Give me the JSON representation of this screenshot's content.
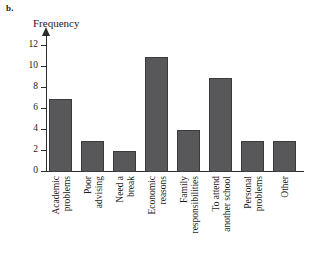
{
  "panel": {
    "label": "b."
  },
  "chart_data": {
    "type": "bar",
    "title": "",
    "subtitle": "",
    "xlabel": "",
    "ylabel": "Frequency",
    "ylim": [
      0,
      13
    ],
    "yticks": [
      0,
      2,
      4,
      6,
      8,
      10,
      12
    ],
    "ytick_labels": [
      "0",
      "2",
      "4",
      "6",
      "8",
      "10",
      "12"
    ],
    "grid": false,
    "legend": null,
    "bar_color": "#58585a",
    "bar_edge_color": "#3b3b3d",
    "axis_color": "#2b2b2b",
    "categories": [
      "Academic problems",
      "Poor advising",
      "Need a break",
      "Economic reasons",
      "Family responsibilities",
      "To attend another school",
      "Personal problems",
      "Other"
    ],
    "category_lines": [
      [
        "Academic",
        "problems"
      ],
      [
        "Poor",
        "advising"
      ],
      [
        "Need a",
        "break"
      ],
      [
        "Economic",
        "reasons"
      ],
      [
        "Family",
        "responsibilities"
      ],
      [
        "To attend",
        "another school"
      ],
      [
        "Personal",
        "problems"
      ],
      [
        "Other"
      ]
    ],
    "values": [
      7,
      3,
      2,
      11,
      4,
      9,
      3,
      3
    ]
  }
}
